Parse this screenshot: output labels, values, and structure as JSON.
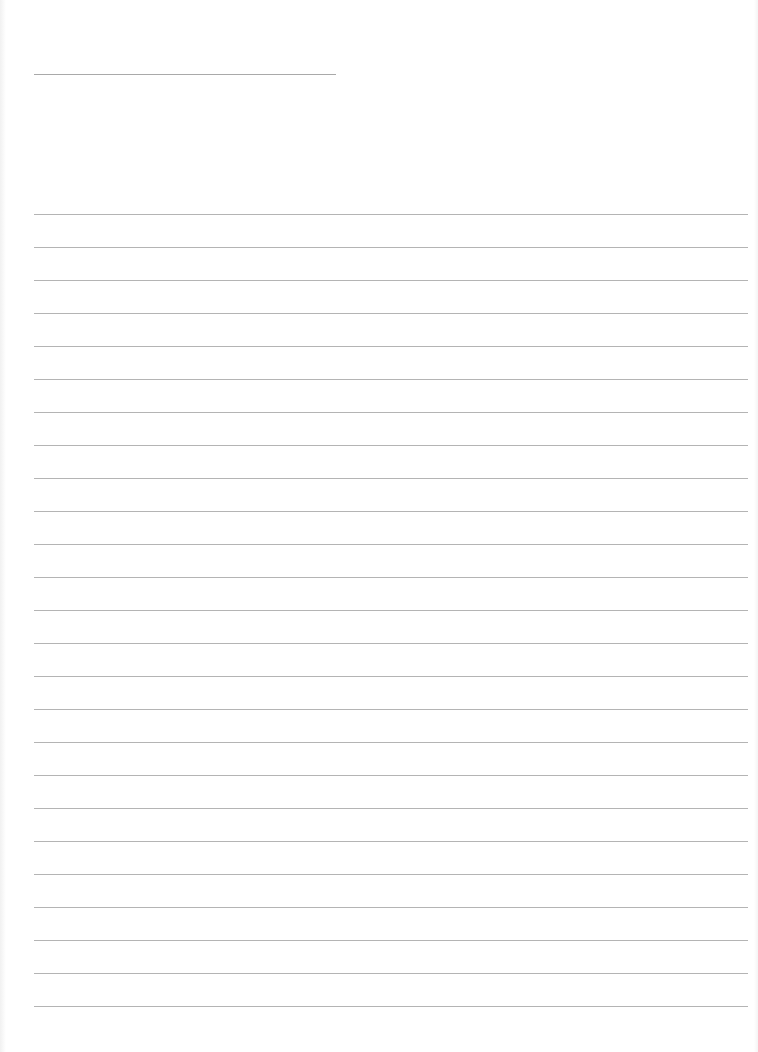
{
  "document": {
    "type": "blank lined sheet",
    "title_line": {
      "x": 34,
      "y": 74,
      "width": 302
    },
    "writing_lines": {
      "count": 25,
      "first_y": 214,
      "spacing": 33,
      "x": 34,
      "width": 714
    },
    "colors": {
      "paper": "#ffffff",
      "rule": "#b4b4b4",
      "title_rule": "#a9a9a9"
    }
  }
}
